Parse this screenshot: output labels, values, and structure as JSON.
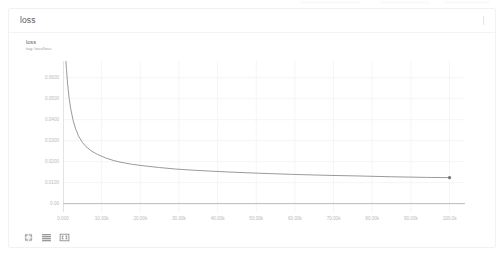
{
  "card": {
    "title": "loss",
    "collapse_toggle_icon": "vertical-handle-icon"
  },
  "chart_header": {
    "series_name": "loss",
    "tag_label": "tag: loss/loss"
  },
  "toolbar": {
    "buttons": [
      {
        "name": "expand-chart-button",
        "icon": "expand-arrows-icon"
      },
      {
        "name": "data-table-button",
        "icon": "list-lines-icon"
      },
      {
        "name": "fit-domain-button",
        "icon": "fit-frame-icon"
      }
    ]
  },
  "colors": {
    "line": "#8b8f94",
    "marker": "#70747a",
    "grid": "#f4f5f6",
    "axis": "#c9ccd0",
    "zero_line": "#b9bcc0",
    "tick_text": "#b6babe",
    "title_text": "#56595c"
  },
  "chart_data": {
    "type": "line",
    "title": "loss",
    "subtitle": "tag: loss/loss",
    "xlabel": "",
    "ylabel": "",
    "xlim": [
      0,
      104000
    ],
    "ylim": [
      -0.004,
      0.068
    ],
    "grid": true,
    "legend": "none",
    "xticks": [
      0,
      10000,
      20000,
      30000,
      40000,
      50000,
      60000,
      70000,
      80000,
      90000,
      100000
    ],
    "xticklabels": [
      "0.000",
      "10.00k",
      "20.00k",
      "30.00k",
      "40.00k",
      "50.00k",
      "60.00k",
      "70.00k",
      "80.00k",
      "90.00k",
      "100.0k"
    ],
    "yticks": [
      0.0,
      0.01,
      0.02,
      0.03,
      0.04,
      0.05,
      0.06
    ],
    "yticklabels": [
      "0.00",
      "0.0100",
      "0.0200",
      "0.0300",
      "0.0400",
      "0.0500",
      "0.0600"
    ],
    "series": [
      {
        "name": "loss",
        "color": "#8b8f94",
        "end_marker": true,
        "x": [
          600,
          900,
          1200,
          1600,
          2000,
          2600,
          3200,
          4000,
          5000,
          6000,
          7500,
          9000,
          11000,
          13000,
          15000,
          18000,
          21000,
          25000,
          29000,
          34000,
          39000,
          45000,
          52000,
          60000,
          68000,
          76000,
          85000,
          94000,
          100000
        ],
        "y": [
          0.072,
          0.064,
          0.057,
          0.05,
          0.0452,
          0.0398,
          0.036,
          0.0323,
          0.0292,
          0.0271,
          0.0249,
          0.0234,
          0.0218,
          0.0206,
          0.0197,
          0.0187,
          0.018,
          0.0172,
          0.0165,
          0.0159,
          0.0154,
          0.0149,
          0.0144,
          0.0139,
          0.0135,
          0.0132,
          0.0128,
          0.0125,
          0.0124
        ]
      }
    ],
    "end_point": {
      "x": 100000,
      "y": 0.0124
    }
  }
}
